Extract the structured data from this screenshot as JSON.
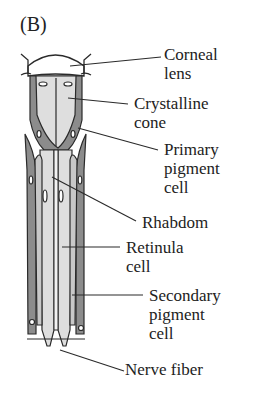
{
  "figure": {
    "panel_label": "(B)",
    "colors": {
      "pigment": "#8c8c8c",
      "light_fill": "#dedede",
      "cornea_fill": "#ffffff",
      "outline": "#2a2a2a"
    },
    "labels": [
      {
        "id": "corneal-lens",
        "line1": "Corneal",
        "line2": "lens",
        "line3": ""
      },
      {
        "id": "crystalline-cone",
        "line1": "Crystalline",
        "line2": "cone",
        "line3": ""
      },
      {
        "id": "primary-pigment-cell",
        "line1": "Primary",
        "line2": "pigment",
        "line3": "cell"
      },
      {
        "id": "rhabdom",
        "line1": "Rhabdom",
        "line2": "",
        "line3": ""
      },
      {
        "id": "retinula-cell",
        "line1": "Retinula",
        "line2": "cell",
        "line3": ""
      },
      {
        "id": "secondary-pigment-cell",
        "line1": "Secondary",
        "line2": "pigment",
        "line3": "cell"
      },
      {
        "id": "nerve-fiber",
        "line1": "Nerve fiber",
        "line2": "",
        "line3": ""
      }
    ]
  }
}
